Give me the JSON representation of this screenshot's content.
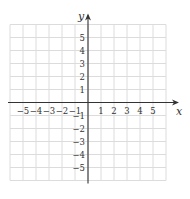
{
  "chart_data": {
    "type": "scatter",
    "title": "",
    "xlabel": "x",
    "ylabel": "y",
    "xlim": [
      -6,
      6
    ],
    "ylim": [
      -6,
      6
    ],
    "grid": true,
    "x_ticks": [
      -5,
      -4,
      -3,
      -2,
      -1,
      1,
      2,
      3,
      4,
      5
    ],
    "y_ticks": [
      5,
      4,
      3,
      2,
      1,
      -1,
      -2,
      -3,
      -4,
      -5
    ],
    "x_tick_labels": [
      "−5",
      "−4",
      "−3",
      "−2",
      "−1",
      "1",
      "2",
      "3",
      "4",
      "5"
    ],
    "y_tick_labels": [
      "5",
      "4",
      "3",
      "2",
      "1",
      "−1",
      "−2",
      "−3",
      "−4",
      "−5"
    ],
    "points": []
  },
  "colors": {
    "grid": "#dcdcdc",
    "axis": "#333333",
    "text": "#333333"
  },
  "layout": {
    "origin_x": 88,
    "origin_y": 102.5,
    "cell": 13,
    "half_cells": 6
  }
}
